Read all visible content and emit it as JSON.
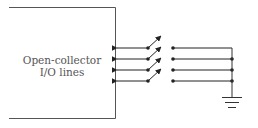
{
  "diagram": {
    "box": {
      "line1": "Open-collector",
      "line2": "I/O lines"
    },
    "lines": [
      {
        "y": 48,
        "switch": "open"
      },
      {
        "y": 59,
        "switch": "open"
      },
      {
        "y": 70,
        "switch": "open"
      },
      {
        "y": 81,
        "switch": "open"
      }
    ],
    "ground": "ground-symbol",
    "colors": {
      "stroke": "#222222",
      "text": "#555555",
      "background": "#ffffff"
    }
  }
}
